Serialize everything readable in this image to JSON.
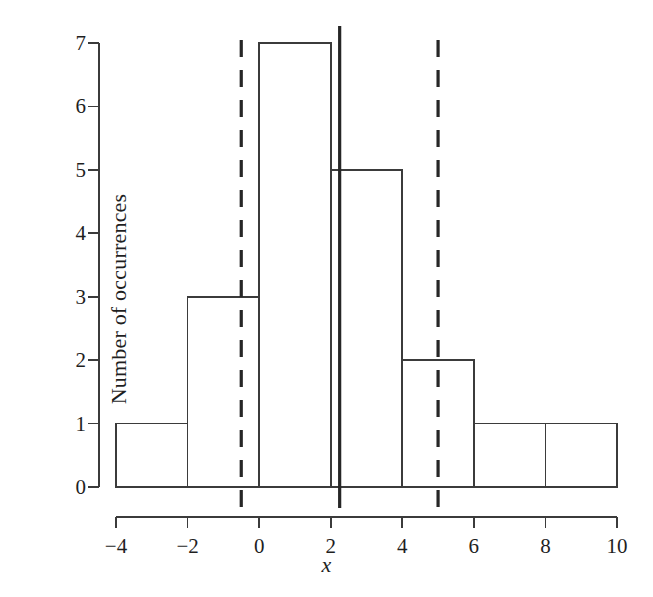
{
  "chart_data": {
    "type": "bar",
    "title": "",
    "subtitle": "",
    "xlabel": "x",
    "ylabel": "Number of occurrences",
    "xlim": [
      -4,
      10
    ],
    "ylim": [
      0,
      7
    ],
    "grid": false,
    "legend": "none",
    "bin_width": 2,
    "bin_edges": [
      -4,
      -2,
      0,
      2,
      4,
      6,
      8,
      10
    ],
    "categories": [
      "-4 to -2",
      "-2 to 0",
      "0 to 2",
      "2 to 4",
      "4 to 6",
      "6 to 8",
      "8 to 10"
    ],
    "values": [
      1,
      3,
      7,
      5,
      2,
      1,
      1
    ],
    "xticks": [
      -4,
      -2,
      0,
      2,
      4,
      6,
      8,
      10
    ],
    "xtick_labels": [
      "−4",
      "−2",
      "0",
      "2",
      "4",
      "6",
      "8",
      "10"
    ],
    "yticks": [
      0,
      1,
      2,
      3,
      4,
      5,
      6,
      7
    ],
    "ytick_labels": [
      "0",
      "1",
      "2",
      "3",
      "4",
      "5",
      "6",
      "7"
    ],
    "annotations": [
      {
        "name": "mean-line",
        "type": "vline",
        "style": "solid",
        "x": 2.25,
        "color": "#262626",
        "width": 3.2
      },
      {
        "name": "lower-bound-line",
        "type": "vline",
        "style": "dashed",
        "x": -0.5,
        "color": "#262626",
        "width": 3.2
      },
      {
        "name": "upper-bound-line",
        "type": "vline",
        "style": "dashed",
        "x": 5.0,
        "color": "#262626",
        "width": 3.2
      }
    ],
    "colors": {
      "bar_edge": "#3b3b3b",
      "bar_fill": "#ffffff",
      "axis": "#3b3b3b",
      "annotation": "#262626",
      "background": "#ffffff",
      "text": "#1f1f1f"
    }
  }
}
